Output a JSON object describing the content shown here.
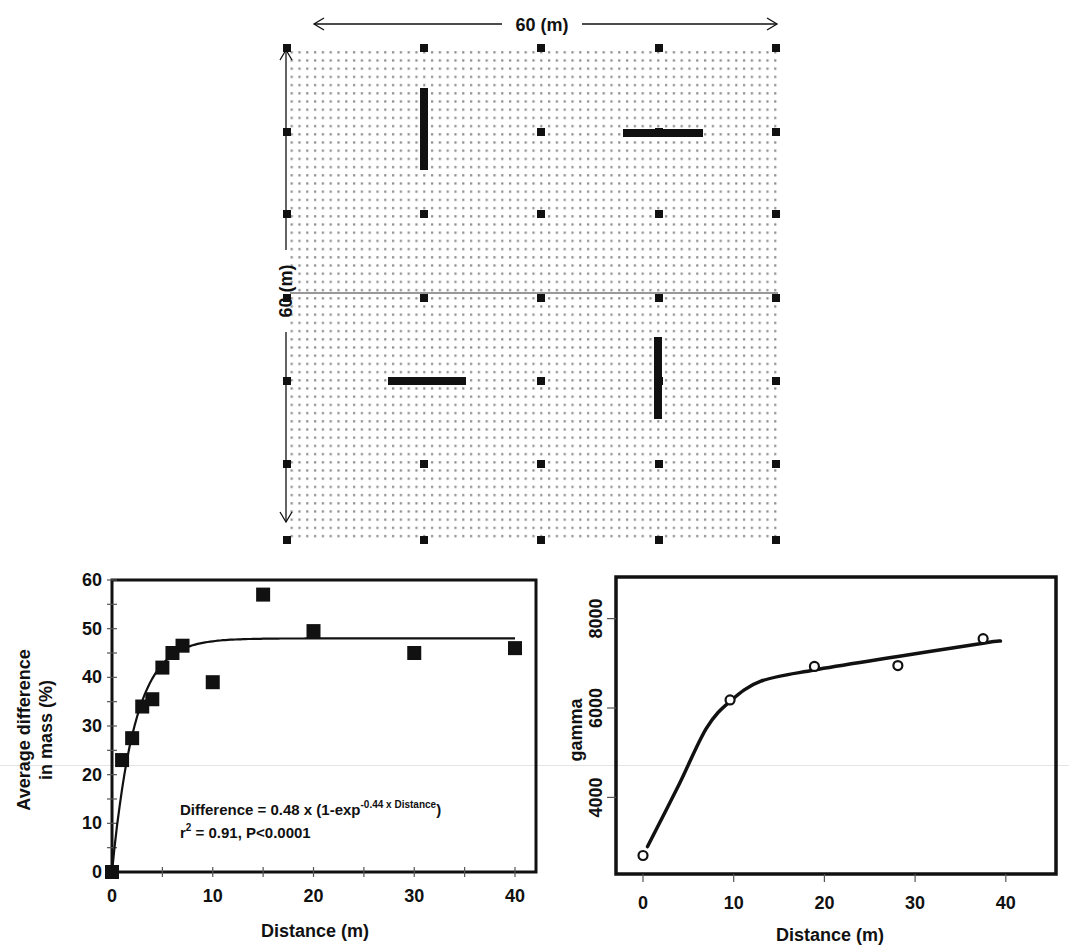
{
  "layout_panel": {
    "width_label": "60 (m)",
    "height_label": "60 (m)",
    "marker_columns_px": [
      287,
      424,
      541,
      659,
      776
    ],
    "marker_rows_px": [
      48,
      132,
      214,
      298,
      381,
      464,
      540
    ],
    "divider_y_px": 293,
    "bars": [
      {
        "orientation": "vertical",
        "x": 424,
        "y1": 88,
        "y2": 170
      },
      {
        "orientation": "horizontal",
        "y": 133,
        "x1": 623,
        "x2": 703
      },
      {
        "orientation": "horizontal",
        "y": 381,
        "x1": 388,
        "x2": 466
      },
      {
        "orientation": "vertical",
        "x": 658,
        "y1": 337,
        "y2": 419
      }
    ],
    "colors": {
      "ink": "#111111",
      "dots": "#8a8a8a"
    }
  },
  "chart_data": [
    {
      "type": "scatter",
      "title": "",
      "xlabel": "Distance (m)",
      "ylabel": "Average difference in mass (%)",
      "ylabel_lines": [
        "Average difference",
        "in mass (%)"
      ],
      "xlim": [
        0,
        40
      ],
      "ylim": [
        0,
        60
      ],
      "xticks": [
        0,
        10,
        20,
        30,
        40
      ],
      "yticks": [
        0,
        10,
        20,
        30,
        40,
        50,
        60
      ],
      "x_tick_labels": [
        "0",
        "10",
        "20",
        "30",
        "40"
      ],
      "y_tick_labels": [
        "0",
        "10",
        "20",
        "30",
        "40",
        "50",
        "60"
      ],
      "grid": false,
      "marker": "filled-square",
      "series": [
        {
          "name": "observed",
          "x": [
            0,
            1,
            2,
            3,
            4,
            5,
            6,
            7,
            10,
            15,
            20,
            30,
            40
          ],
          "values": [
            0,
            23,
            27.5,
            34,
            35.5,
            42,
            45,
            46.5,
            39,
            57,
            49.5,
            45,
            46
          ]
        },
        {
          "name": "fit",
          "kind": "line",
          "equation": "Difference = 48 x (1-exp(-0.44 x Distance))",
          "x": [
            0,
            1,
            2,
            3,
            4,
            5,
            6,
            7,
            8,
            10,
            12,
            15,
            20,
            30,
            40
          ],
          "values": [
            0,
            17.0,
            28.0,
            35.0,
            39.6,
            42.5,
            44.6,
            45.8,
            46.6,
            47.4,
            47.8,
            48.0,
            48.0,
            48.0,
            48.0
          ]
        }
      ],
      "annotation": {
        "line1_prefix": "Difference = 0.48 x (1-exp",
        "line1_superscript": "-0.44 x Distance",
        "line1_suffix": ")",
        "line2_r": "r",
        "line2_sup": "2",
        "line2_rest": " = 0.91, P<0.0001"
      }
    },
    {
      "type": "line",
      "title": "",
      "xlabel": "Distance (m)",
      "ylabel": "gamma",
      "xlim": [
        -3,
        45
      ],
      "ylim": [
        2300,
        8900
      ],
      "xticks": [
        0,
        10,
        20,
        30,
        40
      ],
      "yticks": [
        4000,
        6000,
        8000
      ],
      "x_tick_labels": [
        "0",
        "10",
        "20",
        "30",
        "40"
      ],
      "y_tick_labels": [
        "4000",
        "6000",
        "8000"
      ],
      "grid": false,
      "marker": "open-circle",
      "series": [
        {
          "name": "empirical variogram",
          "x": [
            0,
            9.6,
            18.9,
            28.1,
            37.5
          ],
          "values": [
            2700,
            6180,
            6930,
            6950,
            7550
          ]
        },
        {
          "name": "fitted model",
          "kind": "smooth-line",
          "x": [
            0.5,
            4,
            7,
            9.6,
            13,
            18.9,
            28.1,
            37.5,
            39.4
          ],
          "values": [
            2900,
            4300,
            5550,
            6150,
            6600,
            6850,
            7150,
            7450,
            7500
          ]
        }
      ]
    }
  ]
}
